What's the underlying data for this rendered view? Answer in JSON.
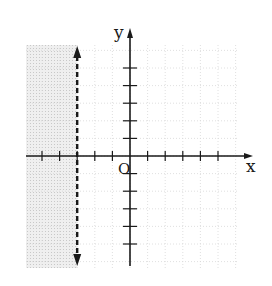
{
  "graph": {
    "description": "Graph of the inequality x < -3 on a coordinate plane",
    "axis_labels": {
      "x": "x",
      "y": "y",
      "origin": "O"
    },
    "origin_px": {
      "x": 130,
      "y": 156
    },
    "unit_px": 17.6,
    "x_range": [
      -6,
      6
    ],
    "y_range": [
      -6,
      6
    ],
    "ticks": {
      "x": [
        -5,
        -4,
        -3,
        -2,
        -1,
        1,
        2,
        3,
        4,
        5
      ],
      "y": [
        -5,
        -4,
        -3,
        -2,
        -1,
        1,
        2,
        3,
        4,
        5
      ]
    },
    "boundary": {
      "type": "vertical",
      "x": -3,
      "style": "dashed",
      "arrows": "both"
    },
    "shaded_side": "left",
    "inequality": "x < -3",
    "colors": {
      "axis": "#1a1a1a",
      "grid": "#d8d8d8",
      "shade": "#e4e4e4",
      "boundary": "#1a1a1a"
    }
  }
}
